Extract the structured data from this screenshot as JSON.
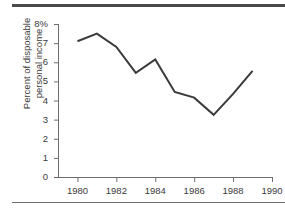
{
  "figure": {
    "background_color": "#ffffff",
    "line_color": "#3a3a3a",
    "axis_color": "#6d6d6d",
    "rule_color": "#4a4a4a"
  },
  "chart_data": {
    "type": "line",
    "title": "",
    "xlabel": "",
    "ylabel": "Percent of disposable personal income",
    "ylabel_lines": [
      "Percent of disposable",
      "personal income"
    ],
    "x": [
      1980,
      1981,
      1982,
      1983,
      1984,
      1985,
      1986,
      1987,
      1988,
      1989
    ],
    "values": [
      7.1,
      7.5,
      6.8,
      5.45,
      6.15,
      4.45,
      4.15,
      3.25,
      4.35,
      5.55
    ],
    "xlim": [
      1979,
      1990
    ],
    "ylim": [
      0,
      8
    ],
    "xticks": [
      1980,
      1982,
      1984,
      1986,
      1988,
      1990
    ],
    "xtick_labels": [
      "1980",
      "1982",
      "1984",
      "1986",
      "1988",
      "1990"
    ],
    "yticks": [
      0,
      1,
      2,
      3,
      4,
      5,
      6,
      7,
      8
    ],
    "ytick_labels": [
      "0",
      "1",
      "2",
      "3",
      "4",
      "5",
      "6",
      "7",
      "8%"
    ],
    "grid": false,
    "legend": null
  }
}
